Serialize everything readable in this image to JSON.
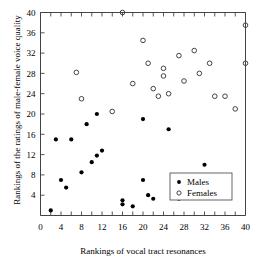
{
  "chart_data": {
    "type": "scatter",
    "title": "",
    "xlabel": "Rankings of vocal tract resonances",
    "ylabel": "Rankings of the ratings of male-female voice quality",
    "xlim": [
      0,
      40
    ],
    "ylim": [
      0,
      40
    ],
    "xticks": [
      0,
      2,
      4,
      6,
      8,
      10,
      12,
      14,
      16,
      18,
      20,
      22,
      24,
      26,
      28,
      30,
      32,
      34,
      36,
      38,
      40
    ],
    "xticklabels": [
      "0",
      "4",
      "8",
      "12",
      "16",
      "20",
      "24",
      "28",
      "32",
      "36",
      "40"
    ],
    "xticklabel_values": [
      0,
      4,
      8,
      12,
      16,
      20,
      24,
      28,
      32,
      36,
      40
    ],
    "yticks": [
      4,
      8,
      12,
      16,
      20,
      24,
      28,
      32,
      36,
      40
    ],
    "yticklabels": [
      "4",
      "8",
      "12",
      "16",
      "20",
      "24",
      "28",
      "32",
      "36",
      "40"
    ],
    "grid": false,
    "legend_position": "center-right",
    "series": [
      {
        "name": "Males",
        "marker": "filled-circle",
        "color": "#000000",
        "points": [
          [
            2,
            1
          ],
          [
            3,
            15
          ],
          [
            4,
            7
          ],
          [
            5,
            5.5
          ],
          [
            6,
            15
          ],
          [
            8,
            8.5
          ],
          [
            9,
            18
          ],
          [
            10,
            10.5
          ],
          [
            11,
            11.8
          ],
          [
            11,
            20
          ],
          [
            12,
            12.8
          ],
          [
            16,
            3
          ],
          [
            16,
            2.2
          ],
          [
            18,
            1.8
          ],
          [
            20,
            7
          ],
          [
            20,
            19
          ],
          [
            21,
            4
          ],
          [
            22,
            3.3
          ],
          [
            25,
            17
          ],
          [
            26,
            4.2
          ],
          [
            27,
            3.3
          ],
          [
            32,
            10
          ]
        ]
      },
      {
        "name": "Females",
        "marker": "open-circle",
        "color": "#444444",
        "points": [
          [
            7,
            28.2
          ],
          [
            8,
            23
          ],
          [
            14,
            20.5
          ],
          [
            16,
            40
          ],
          [
            18,
            26
          ],
          [
            20,
            34.5
          ],
          [
            21,
            30
          ],
          [
            22,
            25
          ],
          [
            23,
            23.5
          ],
          [
            24,
            29
          ],
          [
            24,
            27.5
          ],
          [
            25,
            24
          ],
          [
            27,
            31.5
          ],
          [
            28,
            26.5
          ],
          [
            30,
            32.5
          ],
          [
            31,
            28
          ],
          [
            33,
            30
          ],
          [
            34,
            23.5
          ],
          [
            36,
            23.5
          ],
          [
            38,
            21
          ],
          [
            40,
            37.5
          ],
          [
            40,
            30
          ]
        ]
      }
    ],
    "legend": [
      {
        "label": "Males",
        "marker": "filled-circle"
      },
      {
        "label": "Females",
        "marker": "open-circle"
      }
    ]
  },
  "axes": {
    "x_title": "Rankings of vocal tract resonances",
    "y_title": "Rankings of the ratings of male-female voice quality"
  },
  "legend": {
    "males_label": "Males",
    "females_label": "Females"
  }
}
